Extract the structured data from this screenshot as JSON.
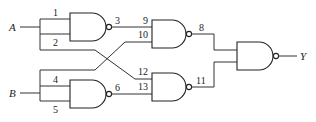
{
  "diagram": {
    "type": "logic-circuit",
    "inputs": [
      {
        "id": "A",
        "label": "A"
      },
      {
        "id": "B",
        "label": "B"
      }
    ],
    "outputs": [
      {
        "id": "Y",
        "label": "Y"
      }
    ],
    "gates": [
      {
        "id": "G1",
        "type": "NAND",
        "input_pins": [
          "1",
          "2"
        ],
        "output_pin": "3"
      },
      {
        "id": "G2",
        "type": "NAND",
        "input_pins": [
          "4",
          "5"
        ],
        "output_pin": "6"
      },
      {
        "id": "G3",
        "type": "NAND",
        "input_pins": [
          "9",
          "10"
        ],
        "output_pin": "8"
      },
      {
        "id": "G4",
        "type": "NAND",
        "input_pins": [
          "12",
          "13"
        ],
        "output_pin": "11"
      },
      {
        "id": "G5",
        "type": "NAND",
        "input_pins": [
          "8",
          "11"
        ],
        "output_pin": "Y"
      }
    ],
    "connections": [
      "A -> pin 1, pin 2, pin 12",
      "B -> pin 4, pin 5, pin 10",
      "pin 3 -> pin 9",
      "pin 6 -> pin 13",
      "pin 8 -> G5 input",
      "pin 11 -> G5 input",
      "G5 output -> Y"
    ],
    "pin_labels": {
      "p1": "1",
      "p2": "2",
      "p3": "3",
      "p4": "4",
      "p5": "5",
      "p6": "6",
      "p8": "8",
      "p9": "9",
      "p10": "10",
      "p11": "11",
      "p12": "12",
      "p13": "13"
    },
    "labels": {
      "A": "A",
      "B": "B",
      "Y": "Y"
    }
  }
}
